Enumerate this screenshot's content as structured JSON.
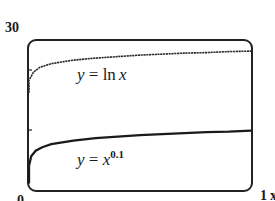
{
  "chart_data": {
    "type": "line",
    "title": "",
    "xlabel": "x",
    "ylabel": "",
    "xlim": [
      0,
      1
    ],
    "ylim": [
      0,
      30
    ],
    "x_tick_labels": [
      "0",
      "1"
    ],
    "y_tick_labels": [
      "0",
      "30"
    ],
    "grid": false,
    "legend": "inline labels",
    "series": [
      {
        "name": "y = ln x",
        "label_parts": {
          "lhs": "y",
          "eq": " = ",
          "fn": "ln",
          "arg": "x"
        },
        "style": "dotted-solid dark",
        "points": [
          [
            0.0,
            22.0
          ],
          [
            0.02,
            23.6
          ],
          [
            0.05,
            24.6
          ],
          [
            0.1,
            25.3
          ],
          [
            0.2,
            26.0
          ],
          [
            0.3,
            26.4
          ],
          [
            0.4,
            26.7
          ],
          [
            0.5,
            27.0
          ],
          [
            0.6,
            27.2
          ],
          [
            0.7,
            27.4
          ],
          [
            0.8,
            27.5
          ],
          [
            0.9,
            27.7
          ],
          [
            1.0,
            27.8
          ]
        ]
      },
      {
        "name": "y = x^0.1",
        "label_parts": {
          "lhs": "y",
          "eq": " = ",
          "base": "x",
          "exp": "0.1"
        },
        "style": "solid dark",
        "points": [
          [
            0.0,
            5.0
          ],
          [
            0.01,
            6.9
          ],
          [
            0.03,
            8.0
          ],
          [
            0.06,
            8.7
          ],
          [
            0.1,
            9.3
          ],
          [
            0.2,
            10.0
          ],
          [
            0.3,
            10.5
          ],
          [
            0.4,
            10.8
          ],
          [
            0.5,
            11.1
          ],
          [
            0.6,
            11.3
          ],
          [
            0.7,
            11.5
          ],
          [
            0.8,
            11.7
          ],
          [
            0.9,
            11.8
          ],
          [
            1.0,
            12.0
          ]
        ]
      }
    ]
  },
  "labels": {
    "y_top": "30",
    "y_bottom": "0",
    "x_right_value": "1",
    "x_right_var": "x"
  }
}
